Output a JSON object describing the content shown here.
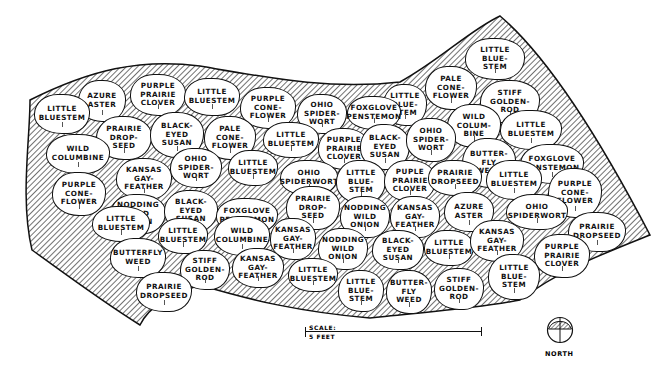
{
  "diagram": {
    "type": "planting-plan",
    "scale": {
      "label": "SCALE:",
      "value": "5 FEET"
    },
    "north": {
      "label": "NORTH"
    },
    "plants": [
      {
        "label": "LITTLE\nBLUE-\nSTEM",
        "x": 465,
        "y": 38,
        "w": 60,
        "h": 42
      },
      {
        "label": "PALE\nCONE-\nFLOWER",
        "x": 425,
        "y": 66,
        "w": 52,
        "h": 44
      },
      {
        "label": "STIFF\nGOLDEN-\nROD",
        "x": 480,
        "y": 80,
        "w": 60,
        "h": 44
      },
      {
        "label": "AZURE\nASTER",
        "x": 78,
        "y": 80,
        "w": 48,
        "h": 42
      },
      {
        "label": "PURPLE\nPRAIRIE\nCLOVER",
        "x": 130,
        "y": 74,
        "w": 56,
        "h": 42
      },
      {
        "label": "LITTLE\nBLUESTEM",
        "x": 184,
        "y": 78,
        "w": 56,
        "h": 38
      },
      {
        "label": "LITTLE\nBLUE-\nSTEM",
        "x": 383,
        "y": 84,
        "w": 44,
        "h": 42
      },
      {
        "label": "PURPLE\nCONE-\nFLOWER",
        "x": 240,
        "y": 87,
        "w": 56,
        "h": 42
      },
      {
        "label": "OHIO\nSPIDER-\nWORT",
        "x": 297,
        "y": 94,
        "w": 50,
        "h": 40
      },
      {
        "label": "FOXGLOVE\nPENSTEMON",
        "x": 347,
        "y": 96,
        "w": 54,
        "h": 34
      },
      {
        "label": "WILD\nCOLUM-\nBINE",
        "x": 447,
        "y": 104,
        "w": 54,
        "h": 44
      },
      {
        "label": "LITTLE\nBLUESTEM",
        "x": 500,
        "y": 110,
        "w": 62,
        "h": 40
      },
      {
        "label": "LITTLE\nBLUESTEM",
        "x": 34,
        "y": 94,
        "w": 56,
        "h": 40
      },
      {
        "label": "PRAIRIE\nDROP-\nSEED",
        "x": 96,
        "y": 116,
        "w": 56,
        "h": 44
      },
      {
        "label": "BLACK-\nEYED\nSUSAN",
        "x": 150,
        "y": 112,
        "w": 54,
        "h": 46
      },
      {
        "label": "PALE\nCONE-\nFLOWER",
        "x": 204,
        "y": 116,
        "w": 52,
        "h": 44
      },
      {
        "label": "LITTLE\nBLUESTEM",
        "x": 263,
        "y": 122,
        "w": 56,
        "h": 36
      },
      {
        "label": "PURPLE\nPRAIRIE\nCLOVER",
        "x": 318,
        "y": 128,
        "w": 52,
        "h": 42
      },
      {
        "label": "BLACK-\nEYED\nSUSAN",
        "x": 360,
        "y": 124,
        "w": 50,
        "h": 46
      },
      {
        "label": "OHIO\nSPIDER-\nWORT",
        "x": 406,
        "y": 118,
        "w": 50,
        "h": 44
      },
      {
        "label": "BUTTER-\nFLY\nWEED",
        "x": 462,
        "y": 138,
        "w": 54,
        "h": 50
      },
      {
        "label": "FOXGLOVE\nPENSTEMON",
        "x": 520,
        "y": 144,
        "w": 64,
        "h": 40
      },
      {
        "label": "WILD\nCOLUMBINE",
        "x": 46,
        "y": 134,
        "w": 64,
        "h": 40
      },
      {
        "label": "KANSAS\nGAY-\nFEATHER",
        "x": 116,
        "y": 158,
        "w": 56,
        "h": 42
      },
      {
        "label": "OHIO\nSPIDER-\nWORT",
        "x": 170,
        "y": 148,
        "w": 52,
        "h": 40
      },
      {
        "label": "LITTLE\nBLUESTEM",
        "x": 228,
        "y": 150,
        "w": 50,
        "h": 36
      },
      {
        "label": "OHIO\nSPIDERWORT",
        "x": 280,
        "y": 160,
        "w": 58,
        "h": 36
      },
      {
        "label": "LITTLE\nBLUE-\nSTEM",
        "x": 336,
        "y": 160,
        "w": 50,
        "h": 44
      },
      {
        "label": "PUPLE\nPRAIRIE\nCLOVER",
        "x": 384,
        "y": 160,
        "w": 52,
        "h": 42
      },
      {
        "label": "PRAIRIE\nDROPSEED",
        "x": 428,
        "y": 160,
        "w": 54,
        "h": 36
      },
      {
        "label": "LITTLE\nBLUESTEM",
        "x": 486,
        "y": 160,
        "w": 56,
        "h": 40
      },
      {
        "label": "PURPLE\nCONE-\nFLOWER",
        "x": 548,
        "y": 168,
        "w": 54,
        "h": 50
      },
      {
        "label": "PURPLE\nCONE-\nFLOWER",
        "x": 52,
        "y": 172,
        "w": 54,
        "h": 44
      },
      {
        "label": "NODDING\nWILD\nONION",
        "x": 110,
        "y": 194,
        "w": 56,
        "h": 40
      },
      {
        "label": "BLACK-\nEYED\nSUSAN",
        "x": 164,
        "y": 190,
        "w": 54,
        "h": 42
      },
      {
        "label": "FOXGLOVE\nPENSTEMON",
        "x": 216,
        "y": 198,
        "w": 62,
        "h": 36
      },
      {
        "label": "PRAIRIE\nDROP-\nSEED",
        "x": 286,
        "y": 186,
        "w": 54,
        "h": 44
      },
      {
        "label": "NODDING\nWILD\nONION",
        "x": 340,
        "y": 196,
        "w": 50,
        "h": 42
      },
      {
        "label": "KANSAS\nGAY-\nFEATHER",
        "x": 390,
        "y": 196,
        "w": 50,
        "h": 42
      },
      {
        "label": "AZURE\nASTER",
        "x": 444,
        "y": 192,
        "w": 50,
        "h": 40
      },
      {
        "label": "OHIO\nSPIDERWORT",
        "x": 506,
        "y": 194,
        "w": 62,
        "h": 36
      },
      {
        "label": "PRAIRIE\nDROPSEED",
        "x": 568,
        "y": 212,
        "w": 58,
        "h": 40
      },
      {
        "label": "LITTLE\nBLUESTEM",
        "x": 92,
        "y": 206,
        "w": 58,
        "h": 36
      },
      {
        "label": "LITTLE\nBLUESTEM",
        "x": 158,
        "y": 218,
        "w": 50,
        "h": 36
      },
      {
        "label": "WILD\nCOLUMBINE",
        "x": 214,
        "y": 216,
        "w": 56,
        "h": 40
      },
      {
        "label": "KANSAS\nGAY-\nFEATHER",
        "x": 270,
        "y": 218,
        "w": 46,
        "h": 42
      },
      {
        "label": "NODDING\nWILD\nONION",
        "x": 318,
        "y": 228,
        "w": 50,
        "h": 42
      },
      {
        "label": "BLACK-\nEYED\nSUSAN",
        "x": 372,
        "y": 230,
        "w": 52,
        "h": 40
      },
      {
        "label": "LITTLE\nBLUESTEM",
        "x": 424,
        "y": 230,
        "w": 50,
        "h": 36
      },
      {
        "label": "KANSAS\nGAY-\nFEATHER",
        "x": 470,
        "y": 220,
        "w": 54,
        "h": 42
      },
      {
        "label": "PURPLE\nPRAIRIE\nCLOVER",
        "x": 534,
        "y": 234,
        "w": 56,
        "h": 44
      },
      {
        "label": "BUTTERFLY\nWEED",
        "x": 110,
        "y": 238,
        "w": 56,
        "h": 40
      },
      {
        "label": "STIFF\nGOLDEN-\nROD",
        "x": 180,
        "y": 250,
        "w": 50,
        "h": 40
      },
      {
        "label": "KANSAS\nGAY-\nFEATHER",
        "x": 232,
        "y": 248,
        "w": 52,
        "h": 40
      },
      {
        "label": "LITTLE\nBLUESTEM",
        "x": 288,
        "y": 258,
        "w": 50,
        "h": 34
      },
      {
        "label": "LITTLE\nBLUE-\nSTEM",
        "x": 338,
        "y": 270,
        "w": 46,
        "h": 42
      },
      {
        "label": "BUTTER-\nFLY\nWEED",
        "x": 386,
        "y": 270,
        "w": 46,
        "h": 44
      },
      {
        "label": "STIFF\nGOLDEN-\nROD",
        "x": 434,
        "y": 268,
        "w": 50,
        "h": 42
      },
      {
        "label": "LITTLE\nBLUE-\nSTEM",
        "x": 488,
        "y": 254,
        "w": 52,
        "h": 46
      },
      {
        "label": "PRAIRIE\nDROPSEED",
        "x": 136,
        "y": 272,
        "w": 56,
        "h": 40
      }
    ]
  }
}
